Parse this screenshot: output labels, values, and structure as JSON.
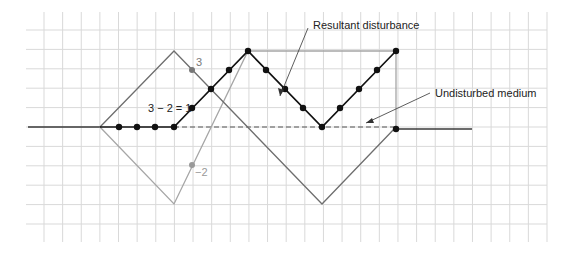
{
  "diagram": {
    "labels": {
      "resultant": "Resultant disturbance",
      "undisturbed": "Undisturbed medium",
      "positive_value": "3",
      "negative_value": "−2",
      "sum_equation": "3 − 2 = 1"
    },
    "colors": {
      "grid": "#d9d9d9",
      "positive_pulse": "#6e6e6e",
      "negative_pulse": "#a6a6a6",
      "resultant": "#111111",
      "undisturbed": "#3a3a3a",
      "label_gray": "#777777",
      "label_dark": "#222222"
    },
    "grid": {
      "x_start": 44,
      "x_end": 547,
      "y_start": 30,
      "y_end": 224,
      "columns": 27,
      "rows": 10
    },
    "pulses": {
      "positive_pulse": {
        "points": [
          [
            100,
            127
          ],
          [
            174,
            51
          ],
          [
            322,
            204
          ],
          [
            396,
            127
          ]
        ]
      },
      "negative_pulse": {
        "points": [
          [
            100,
            127
          ],
          [
            174,
            204
          ],
          [
            248,
            51
          ],
          [
            396,
            51
          ],
          [
            396,
            127
          ]
        ]
      },
      "resultant": {
        "points": [
          [
            174,
            127
          ],
          [
            248,
            51
          ],
          [
            322,
            127
          ],
          [
            396,
            51
          ]
        ]
      }
    },
    "resultant_dots": [
      [
        119,
        127
      ],
      [
        137,
        127
      ],
      [
        155,
        127
      ],
      [
        174,
        127
      ],
      [
        192,
        108
      ],
      [
        211,
        89
      ],
      [
        229,
        70
      ],
      [
        248,
        51
      ],
      [
        266,
        70
      ],
      [
        285,
        89
      ],
      [
        303,
        108
      ],
      [
        322,
        127
      ],
      [
        340,
        108
      ],
      [
        359,
        89
      ],
      [
        377,
        70
      ],
      [
        396,
        51
      ],
      [
        396,
        129
      ]
    ]
  }
}
